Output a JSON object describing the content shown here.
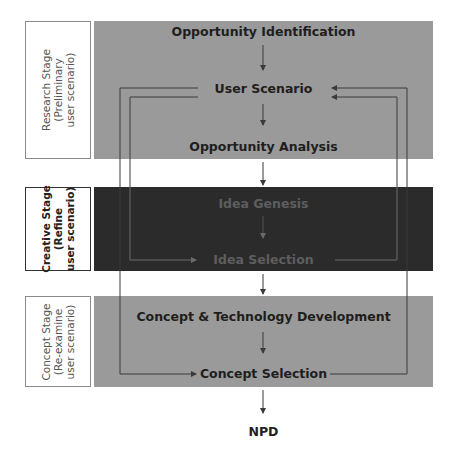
{
  "stages": [
    {
      "id": "research",
      "label_line1": "Research Stage",
      "label_line2": "(Preliminary",
      "label_line3": "user scenario)",
      "fill": "#9a9a9a"
    },
    {
      "id": "creative",
      "label_line1": "Creative Stage",
      "label_line2": "(Refine",
      "label_line3": "user scenario)",
      "fill": "#2b2b2b"
    },
    {
      "id": "concept",
      "label_line1": "Concept Stage",
      "label_line2": "(Re-examine",
      "label_line3": "user scenario)",
      "fill": "#9a9a9a"
    }
  ],
  "steps": {
    "opportunity_identification": "Opportunity Identification",
    "user_scenario": "User Scenario",
    "opportunity_analysis": "Opportunity Analysis",
    "idea_genesis": "Idea Genesis",
    "idea_selection": "Idea Selection",
    "concept_technology_development": "Concept & Technology Development",
    "concept_selection": "Concept Selection",
    "output": "NPD"
  },
  "feedback_loops": [
    {
      "from": "Idea Selection",
      "to": "User Scenario",
      "side": "both"
    },
    {
      "from": "Concept Selection",
      "to": "User Scenario",
      "side": "both"
    }
  ],
  "colors": {
    "light_stage": "#9a9a9a",
    "dark_stage": "#2b2b2b",
    "line": "#3a3a3a",
    "line_on_dark": "#6a6a6a"
  }
}
